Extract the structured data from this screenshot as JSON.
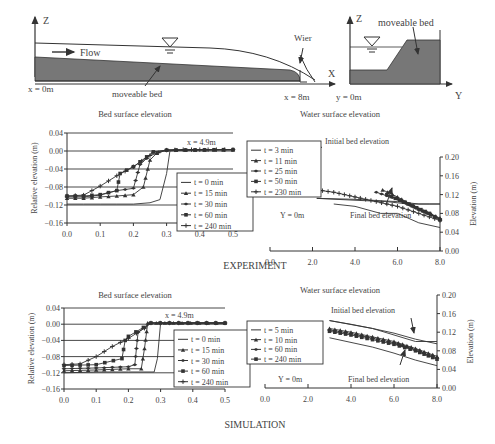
{
  "schematic": {
    "left": {
      "axis_z": "Z",
      "axis_x": "X",
      "flow": "Flow",
      "bed": "moveable bed",
      "wier": "Wier",
      "x0": "x = 0m",
      "x8": "x = 8m"
    },
    "right": {
      "axis_z": "Z",
      "axis_y": "Y",
      "bed": "moveable bed",
      "y0": "y = 0m"
    }
  },
  "sections": {
    "experiment": "EXPERIMENT",
    "simulation": "SIMULATION"
  },
  "chart_data": [
    {
      "id": "exp-bed",
      "type": "line",
      "title": "Bed surface elevation",
      "xlabel": "",
      "ylabel": "Relative elevation (m)",
      "annotation": "x = 4.9m",
      "xlim": [
        0,
        0.5
      ],
      "ylim": [
        -0.16,
        0.04
      ],
      "xticks": [
        "0.0",
        "0.1",
        "0.2",
        "0.3",
        "0.4",
        "0.5"
      ],
      "yticks": [
        "0.04",
        "0.00",
        "−0.04",
        "−0.08",
        "−0.12",
        "−0.16"
      ],
      "legend": [
        "t = 0 min",
        "t = 15 min",
        "t = 30 min",
        "t = 60 min",
        "t = 240 min"
      ],
      "series": [
        {
          "name": "t = 0 min",
          "x": [
            0,
            0.05,
            0.1,
            0.15,
            0.2,
            0.25,
            0.28,
            0.3,
            0.31,
            0.35,
            0.4,
            0.5
          ],
          "y": [
            -0.118,
            -0.118,
            -0.118,
            -0.118,
            -0.118,
            -0.115,
            -0.108,
            -0.05,
            0,
            0.002,
            0.003,
            0.003
          ]
        },
        {
          "name": "t = 15 min",
          "x": [
            0,
            0.05,
            0.1,
            0.15,
            0.2,
            0.23,
            0.25,
            0.27,
            0.3,
            0.5
          ],
          "y": [
            -0.105,
            -0.105,
            -0.102,
            -0.1,
            -0.097,
            -0.08,
            -0.02,
            -0.005,
            0.002,
            0.003
          ]
        },
        {
          "name": "t = 30 min",
          "x": [
            0,
            0.05,
            0.1,
            0.15,
            0.2,
            0.22,
            0.26,
            0.3,
            0.5
          ],
          "y": [
            -0.102,
            -0.102,
            -0.098,
            -0.088,
            -0.083,
            -0.03,
            -0.003,
            0.002,
            0.003
          ]
        },
        {
          "name": "t = 60 min",
          "x": [
            0,
            0.05,
            0.1,
            0.15,
            0.16,
            0.2,
            0.26,
            0.3,
            0.5
          ],
          "y": [
            -0.1,
            -0.1,
            -0.097,
            -0.088,
            -0.05,
            -0.035,
            -0.002,
            0.002,
            0.003
          ]
        },
        {
          "name": "t = 240 min",
          "x": [
            0,
            0.05,
            0.1,
            0.15,
            0.2,
            0.25,
            0.3,
            0.35,
            0.4,
            0.5
          ],
          "y": [
            -0.1,
            -0.098,
            -0.078,
            -0.055,
            -0.035,
            -0.01,
            0.002,
            0.003,
            0.003,
            0.003
          ]
        }
      ]
    },
    {
      "id": "exp-water",
      "type": "line",
      "title": "Water surface elevation",
      "xlabel": "",
      "ylabel": "Elevation (m)",
      "annotations": [
        "Initial bed elevation",
        "Final bed elevation",
        "Y = 0m"
      ],
      "xlim": [
        0,
        8
      ],
      "ylim": [
        0,
        0.2
      ],
      "xticks": [
        "0.0",
        "2.0",
        "4.0",
        "6.0",
        "8.0"
      ],
      "yticks": [
        "0.20",
        "0.16",
        "0.12",
        "0.08",
        "0.04",
        "0.00"
      ],
      "legend": [
        "t = 3 min",
        "t = 11 min",
        "t = 25 min",
        "t = 50 min",
        "t = 230 min"
      ],
      "series": [
        {
          "name": "t = 3 min",
          "x": [
            2.2,
            4,
            6,
            7,
            8
          ],
          "y": [
            0.112,
            0.11,
            0.105,
            0.1,
            0.1
          ]
        },
        {
          "name": "t = 11 min",
          "x": [
            5.3,
            6,
            7,
            8
          ],
          "y": [
            0.13,
            0.115,
            0.09,
            0.07
          ]
        },
        {
          "name": "t = 25 min",
          "x": [
            5,
            6,
            7,
            8
          ],
          "y": [
            0.125,
            0.11,
            0.088,
            0.068
          ]
        },
        {
          "name": "t = 50 min",
          "x": [
            5.5,
            6.5,
            7.5,
            8
          ],
          "y": [
            0.12,
            0.1,
            0.08,
            0.066
          ]
        },
        {
          "name": "t = 230 min",
          "x": [
            2.2,
            3,
            4,
            5,
            6,
            7,
            8
          ],
          "y": [
            0.13,
            0.125,
            0.115,
            0.105,
            0.095,
            0.08,
            0.065
          ]
        },
        {
          "name": "Initial bed",
          "x": [
            2.2,
            4,
            5.5,
            6.5,
            7.5,
            8
          ],
          "y": [
            0.112,
            0.108,
            0.105,
            0.1,
            0.1,
            0.1
          ]
        },
        {
          "name": "Final bed",
          "x": [
            3,
            4,
            5.2,
            6,
            7,
            8
          ],
          "y": [
            0.1,
            0.095,
            0.08,
            0.08,
            0.06,
            0.05
          ]
        }
      ]
    },
    {
      "id": "sim-bed",
      "type": "line",
      "title": "Bed surface elevation",
      "xlabel": "",
      "ylabel": "Relative elevation (m)",
      "annotation": "x = 4.9m",
      "xlim": [
        0,
        0.5
      ],
      "ylim": [
        -0.16,
        0.04
      ],
      "xticks": [
        "0.0",
        "0.1",
        "0.2",
        "0.3",
        "0.4",
        "0.5"
      ],
      "yticks": [
        "0.04",
        "0.00",
        "−0.04",
        "−0.08",
        "−0.12",
        "−0.16"
      ],
      "legend": [
        "t = 0 min",
        "t = 15 min",
        "t = 30 min",
        "t = 60 min",
        "t = 240 min"
      ],
      "series": [
        {
          "name": "t = 0 min",
          "x": [
            0,
            0.1,
            0.2,
            0.28,
            0.29,
            0.3,
            0.5
          ],
          "y": [
            -0.12,
            -0.118,
            -0.118,
            -0.118,
            -0.085,
            0.003,
            0.003
          ]
        },
        {
          "name": "t = 15 min",
          "x": [
            0,
            0.1,
            0.2,
            0.24,
            0.25,
            0.26,
            0.5
          ],
          "y": [
            -0.115,
            -0.113,
            -0.11,
            -0.11,
            -0.06,
            0.003,
            0.003
          ]
        },
        {
          "name": "t = 30 min",
          "x": [
            0,
            0.1,
            0.2,
            0.22,
            0.23,
            0.27,
            0.5
          ],
          "y": [
            -0.11,
            -0.108,
            -0.105,
            -0.1,
            -0.02,
            0.003,
            0.003
          ]
        },
        {
          "name": "t = 60 min",
          "x": [
            0,
            0.1,
            0.18,
            0.19,
            0.2,
            0.27,
            0.5
          ],
          "y": [
            -0.102,
            -0.1,
            -0.085,
            -0.04,
            -0.03,
            0.003,
            0.003
          ]
        },
        {
          "name": "t = 240 min",
          "x": [
            0,
            0.05,
            0.1,
            0.15,
            0.2,
            0.25,
            0.27,
            0.5
          ],
          "y": [
            -0.1,
            -0.098,
            -0.08,
            -0.055,
            -0.035,
            -0.01,
            0.003,
            0.003
          ]
        }
      ]
    },
    {
      "id": "sim-water",
      "type": "line",
      "title": "Water surface elevation",
      "xlabel": "",
      "ylabel": "Elevation (m)",
      "annotations": [
        "Initial bed elevation",
        "Final bed elevation",
        "Y = 0m"
      ],
      "xlim": [
        0,
        8
      ],
      "ylim": [
        0,
        0.2
      ],
      "xticks": [
        "0.0",
        "2.0",
        "4.0",
        "6.0",
        "8.0"
      ],
      "yticks": [
        "0.20",
        "0.16",
        "0.12",
        "0.08",
        "0.04",
        "0.00"
      ],
      "legend": [
        "t = 5 min",
        "t = 10 min",
        "t = 60 min",
        "t = 240 min"
      ],
      "series": [
        {
          "name": "t = 5 min",
          "x": [
            3,
            4,
            5,
            6,
            7,
            8
          ],
          "y": [
            0.145,
            0.137,
            0.128,
            0.118,
            0.105,
            0.095
          ]
        },
        {
          "name": "t = 10 min",
          "x": [
            3,
            4,
            5,
            6,
            7,
            8
          ],
          "y": [
            0.128,
            0.12,
            0.11,
            0.1,
            0.085,
            0.068
          ]
        },
        {
          "name": "t = 60 min",
          "x": [
            3,
            4,
            5,
            6,
            7,
            8
          ],
          "y": [
            0.125,
            0.117,
            0.107,
            0.097,
            0.082,
            0.064
          ]
        },
        {
          "name": "t = 240 min",
          "x": [
            3,
            4,
            5,
            6,
            7,
            8
          ],
          "y": [
            0.122,
            0.114,
            0.104,
            0.094,
            0.08,
            0.062
          ]
        },
        {
          "name": "Initial bed",
          "x": [
            3,
            5,
            7,
            8
          ],
          "y": [
            0.145,
            0.128,
            0.1,
            0.1
          ]
        },
        {
          "name": "Final bed",
          "x": [
            3,
            4,
            5,
            6,
            7,
            8
          ],
          "y": [
            0.108,
            0.098,
            0.088,
            0.075,
            0.06,
            0.048
          ]
        }
      ]
    }
  ]
}
